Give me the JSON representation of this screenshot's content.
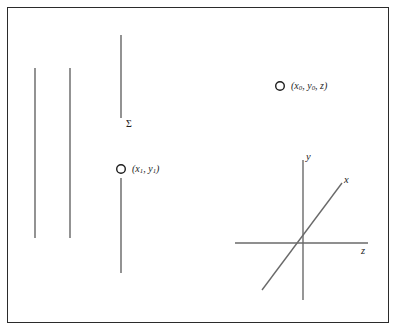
{
  "figure": {
    "background_color": "#ffffff",
    "border_color": "#2b2b2b",
    "stroke_color": "#3a3a3a",
    "text_color": "#1d1d1d",
    "width": 398,
    "height": 333
  },
  "field_lines": [
    {
      "name": "field-line-1",
      "x": 35,
      "y_top": 68,
      "y_bottom": 238
    },
    {
      "name": "field-line-2",
      "x": 70,
      "y_top": 68,
      "y_bottom": 238
    },
    {
      "name": "field-line-3-upper",
      "x": 121,
      "y_top": 35,
      "y_bottom": 118
    },
    {
      "name": "field-line-3-lower",
      "x": 121,
      "y_top": 178,
      "y_bottom": 273
    }
  ],
  "surface": {
    "sigma_label": "Σ",
    "sigma_x": 126,
    "sigma_y": 119
  },
  "points": [
    {
      "name": "point-x1-y1",
      "cx": 121,
      "cy": 169,
      "r": 4.3,
      "label_prefix": "(",
      "label_main_1": "x",
      "label_sub_1": "1",
      "label_sep": ", ",
      "label_main_2": "y",
      "label_sub_2": "1",
      "label_suffix": ")",
      "label_x": 132,
      "label_y": 164
    },
    {
      "name": "point-x0-y0-z",
      "cx": 280,
      "cy": 86,
      "r": 4.3,
      "label_prefix": "(",
      "label_main_1": "x",
      "label_sub_1": "0",
      "label_sep": ", ",
      "label_main_2": "y",
      "label_sub_2": "0",
      "label_tail": ", z)",
      "label_x": 291,
      "label_y": 81
    }
  ],
  "axes": {
    "origin_x": 303,
    "origin_y": 243,
    "y_axis": {
      "x": 303,
      "y_top": 160,
      "y_bottom": 300,
      "label": "y",
      "label_x": 306,
      "label_y": 154
    },
    "z_axis": {
      "y": 243,
      "x_left": 235,
      "x_right": 368,
      "label": "z",
      "label_x": 361,
      "label_y": 248
    },
    "x_axis": {
      "x1": 262,
      "y1": 290,
      "x2": 342,
      "y2": 183,
      "label": "x",
      "label_x": 344,
      "label_y": 177
    }
  }
}
